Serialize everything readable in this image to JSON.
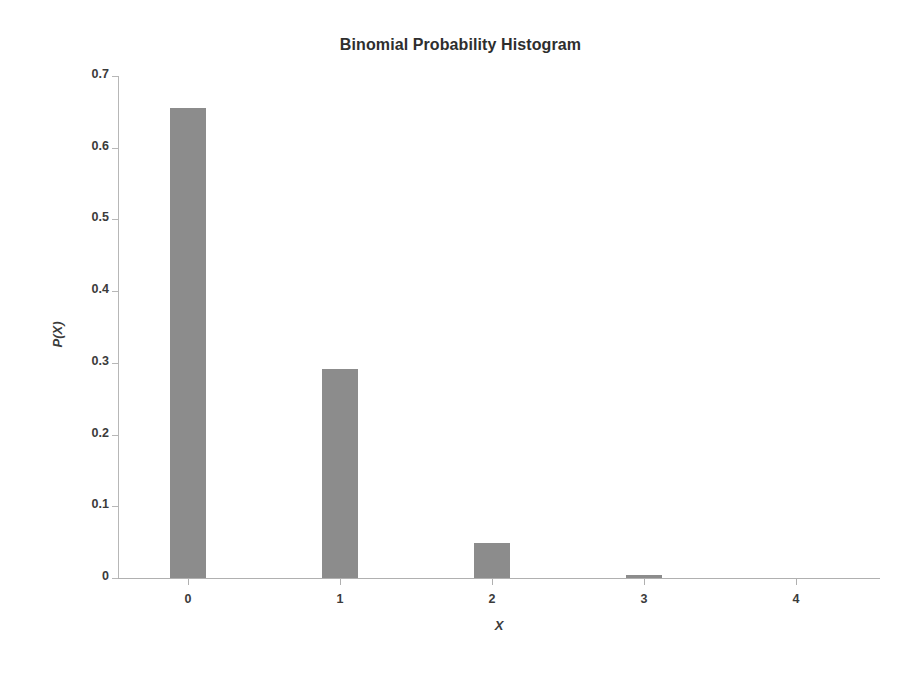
{
  "chart_data": {
    "type": "bar",
    "title": "Binomial Probability Histogram",
    "xlabel": "X",
    "ylabel": "P(X)",
    "categories": [
      "0",
      "1",
      "2",
      "3",
      "4"
    ],
    "values": [
      0.656,
      0.292,
      0.049,
      0.004,
      0.0001
    ],
    "series": [
      {
        "name": "P(X)",
        "values": [
          0.656,
          0.292,
          0.049,
          0.004,
          0.0001
        ]
      }
    ],
    "ylim": [
      0,
      0.7
    ],
    "ytick_labels": [
      "0",
      "0.1",
      "0.2",
      "0.3",
      "0.4",
      "0.5",
      "0.6",
      "0.7"
    ],
    "ytick_values": [
      0,
      0.1,
      0.2,
      0.3,
      0.4,
      0.5,
      0.6,
      0.7
    ],
    "xtick_labels": [
      "0",
      "1",
      "2",
      "3",
      "4"
    ],
    "grid": false,
    "legend": false,
    "legend_position": "none",
    "bar_color": "#8c8c8c",
    "axis_color": "#b0b0b0",
    "text_color": "#3b3b3b",
    "background_color": "#ffffff"
  }
}
